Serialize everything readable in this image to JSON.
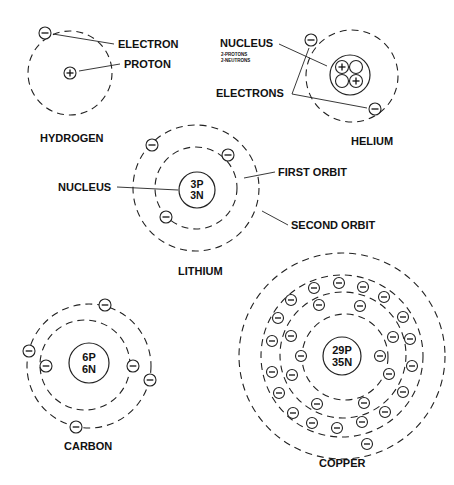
{
  "diagram": {
    "title_labels": {
      "hydrogen": "HYDROGEN",
      "helium": "HELIUM",
      "lithium": "LITHIUM",
      "carbon": "CARBON",
      "copper": "COPPER"
    },
    "callouts": {
      "electron": "ELECTRON",
      "proton": "PROTON",
      "nucleus_helium": "NUCLEUS",
      "helium_sub1": "2-PROTONS",
      "helium_sub2": "2-NEUTRONS",
      "electrons": "ELECTRONS",
      "nucleus_lithium": "NUCLEUS",
      "first_orbit": "FIRST ORBIT",
      "second_orbit": "SECOND ORBIT"
    },
    "nuclei": {
      "lithium": [
        "3P",
        "3N"
      ],
      "carbon": [
        "6P",
        "6N"
      ],
      "copper": [
        "29P",
        "35N"
      ]
    },
    "atoms": {
      "hydrogen": {
        "cx": 70,
        "cy": 73,
        "orbits": [
          42
        ],
        "electrons": [
          [
            45,
            33
          ]
        ]
      },
      "helium": {
        "cx": 352,
        "cy": 76,
        "orbits": [
          46
        ],
        "nucleus_r": 20,
        "electrons": [
          [
            311,
            40
          ],
          [
            375,
            109
          ]
        ]
      },
      "lithium": {
        "cx": 196,
        "cy": 188,
        "orbits": [
          41,
          63
        ],
        "nucleus_r": 18,
        "electrons": [
          [
            152,
            145
          ],
          [
            228,
            155
          ],
          [
            166,
            217
          ]
        ]
      },
      "carbon": {
        "cx": 85,
        "cy": 365,
        "orbits": [
          45,
          64
        ],
        "nucleus_r": 20,
        "electrons": [
          [
            105,
            305
          ],
          [
            29,
            351
          ],
          [
            46,
            366
          ],
          [
            133,
            366
          ],
          [
            150,
            380
          ],
          [
            76,
            427
          ]
        ]
      },
      "copper": {
        "cx": 345,
        "cy": 357,
        "orbits": [
          43,
          63,
          84,
          109
        ],
        "nucleus_r": 19,
        "electrons": [
          [
            301,
            356
          ],
          [
            380,
            356
          ],
          [
            319,
            305
          ],
          [
            360,
            306
          ],
          [
            291,
            336
          ],
          [
            393,
            337
          ],
          [
            292,
            375
          ],
          [
            389,
            374
          ],
          [
            317,
            404
          ],
          [
            364,
            403
          ],
          [
            314,
            288
          ],
          [
            339,
            283
          ],
          [
            363,
            287
          ],
          [
            384,
            297
          ],
          [
            403,
            317
          ],
          [
            410,
            339
          ],
          [
            412,
            366
          ],
          [
            403,
            392
          ],
          [
            385,
            412
          ],
          [
            362,
            422
          ],
          [
            337,
            428
          ],
          [
            312,
            423
          ],
          [
            293,
            413
          ],
          [
            279,
            393
          ],
          [
            272,
            372
          ],
          [
            272,
            341
          ],
          [
            278,
            318
          ],
          [
            291,
            300
          ],
          [
            367,
            444
          ]
        ]
      }
    }
  }
}
